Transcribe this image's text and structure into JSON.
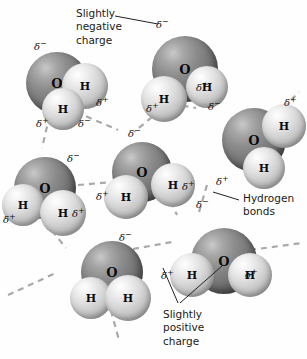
{
  "figure": {
    "background_color": "#fefefe",
    "bond_color": "#a9a9a9",
    "oxygen_color": "#6e6e6e",
    "hydrogen_color": "#d8d8d8",
    "text_color": "#1a1a1a"
  },
  "labels": {
    "negative": "Slightly\nnegative\ncharge",
    "hydrogen_bonds": "Hydrogen\nbonds",
    "positive": "Slightly\npositive\ncharge"
  },
  "atom_symbols": {
    "oxygen": "O",
    "hydrogen": "H"
  },
  "charge_symbols": {
    "negative": "δ",
    "negative_sign": "−",
    "positive": "δ",
    "positive_sign": "+"
  },
  "molecules": [
    {
      "id": "molecule-top-left",
      "atoms": [
        {
          "element": "O",
          "x": 26,
          "y": 52,
          "r": 31
        },
        {
          "element": "H",
          "x": 62,
          "y": 63,
          "r": 23
        },
        {
          "element": "H",
          "x": 42,
          "y": 88,
          "r": 21
        }
      ]
    },
    {
      "id": "molecule-top-right",
      "atoms": [
        {
          "element": "O",
          "x": 152,
          "y": 36,
          "r": 33
        },
        {
          "element": "H",
          "x": 141,
          "y": 76,
          "r": 23
        },
        {
          "element": "H",
          "x": 186,
          "y": 66,
          "r": 21
        }
      ]
    },
    {
      "id": "molecule-right-edge",
      "atoms": [
        {
          "element": "O",
          "x": 222,
          "y": 108,
          "r": 32
        },
        {
          "element": "H",
          "x": 262,
          "y": 104,
          "r": 22
        },
        {
          "element": "H",
          "x": 243,
          "y": 147,
          "r": 21
        }
      ]
    },
    {
      "id": "molecule-left-middle",
      "atoms": [
        {
          "element": "O",
          "x": 14,
          "y": 157,
          "r": 31
        },
        {
          "element": "H",
          "x": 2,
          "y": 184,
          "r": 21
        },
        {
          "element": "H",
          "x": 40,
          "y": 190,
          "r": 23
        }
      ]
    },
    {
      "id": "molecule-center",
      "atoms": [
        {
          "element": "O",
          "x": 112,
          "y": 142,
          "r": 30
        },
        {
          "element": "H",
          "x": 104,
          "y": 175,
          "r": 22
        },
        {
          "element": "H",
          "x": 151,
          "y": 163,
          "r": 22
        }
      ]
    },
    {
      "id": "molecule-bottom-left",
      "atoms": [
        {
          "element": "O",
          "x": 81,
          "y": 241,
          "r": 31
        },
        {
          "element": "H",
          "x": 70,
          "y": 277,
          "r": 21
        },
        {
          "element": "H",
          "x": 105,
          "y": 275,
          "r": 23
        }
      ]
    },
    {
      "id": "molecule-bottom-right",
      "atoms": [
        {
          "element": "O",
          "x": 191,
          "y": 228,
          "r": 33
        },
        {
          "element": "H",
          "x": 170,
          "y": 253,
          "r": 22
        },
        {
          "element": "H",
          "x": 228,
          "y": 253,
          "r": 22
        }
      ]
    }
  ],
  "charge_markers": [
    {
      "id": "charge-1",
      "sign": "negative",
      "x": 34,
      "y": 40
    },
    {
      "id": "charge-2",
      "sign": "negative",
      "x": 156,
      "y": 18
    },
    {
      "id": "charge-3",
      "sign": "positive",
      "x": 96,
      "y": 96
    },
    {
      "id": "charge-4",
      "sign": "positive",
      "x": 36,
      "y": 117
    },
    {
      "id": "charge-5",
      "sign": "positive",
      "x": 146,
      "y": 102
    },
    {
      "id": "charge-6",
      "sign": "positive",
      "x": 196,
      "y": 81
    },
    {
      "id": "charge-7",
      "sign": "negative",
      "x": 208,
      "y": 100
    },
    {
      "id": "charge-8",
      "sign": "positive",
      "x": 284,
      "y": 96
    },
    {
      "id": "charge-9",
      "sign": "negative",
      "x": 128,
      "y": 127
    },
    {
      "id": "charge-10",
      "sign": "negative",
      "x": 67,
      "y": 152
    },
    {
      "id": "charge-11",
      "sign": "positive",
      "x": 3,
      "y": 213
    },
    {
      "id": "charge-12",
      "sign": "positive",
      "x": 96,
      "y": 190
    },
    {
      "id": "charge-13",
      "sign": "positive",
      "x": 182,
      "y": 180
    },
    {
      "id": "charge-14",
      "sign": "positive",
      "x": 72,
      "y": 207
    },
    {
      "id": "charge-15",
      "sign": "positive",
      "x": 216,
      "y": 175
    },
    {
      "id": "charge-16",
      "sign": "negative",
      "x": 196,
      "y": 198
    },
    {
      "id": "charge-17",
      "sign": "negative",
      "x": 119,
      "y": 231
    },
    {
      "id": "charge-18",
      "sign": "positive",
      "x": 161,
      "y": 269
    },
    {
      "id": "charge-19",
      "sign": "positive",
      "x": 245,
      "y": 268
    },
    {
      "id": "charge-20",
      "sign": "negative",
      "x": 78,
      "y": 117
    }
  ],
  "hydrogen_bonds": [
    {
      "id": "bond-1",
      "x1": 76,
      "y1": 112,
      "x2": 118,
      "y2": 130
    },
    {
      "id": "bond-2",
      "x1": 152,
      "y1": 117,
      "x2": 134,
      "y2": 132
    },
    {
      "id": "bond-3",
      "x1": 150,
      "y1": 100,
      "x2": 196,
      "y2": 108
    },
    {
      "id": "bond-4",
      "x1": 207,
      "y1": 94,
      "x2": 224,
      "y2": 104
    },
    {
      "id": "bond-5",
      "x1": 276,
      "y1": 116,
      "x2": 299,
      "y2": 92
    },
    {
      "id": "bond-6",
      "x1": 52,
      "y1": 105,
      "x2": 42,
      "y2": 148
    },
    {
      "id": "bond-7",
      "x1": 78,
      "y1": 185,
      "x2": 112,
      "y2": 182
    },
    {
      "id": "bond-8",
      "x1": 45,
      "y1": 222,
      "x2": 66,
      "y2": 248
    },
    {
      "id": "bond-9",
      "x1": 161,
      "y1": 182,
      "x2": 177,
      "y2": 215
    },
    {
      "id": "bond-10",
      "x1": 207,
      "y1": 185,
      "x2": 199,
      "y2": 212
    },
    {
      "id": "bond-11",
      "x1": 133,
      "y1": 249,
      "x2": 172,
      "y2": 242
    },
    {
      "id": "bond-12",
      "x1": 8,
      "y1": 295,
      "x2": 58,
      "y2": 272
    },
    {
      "id": "bond-13",
      "x1": 108,
      "y1": 300,
      "x2": 119,
      "y2": 340
    },
    {
      "id": "bond-14",
      "x1": 250,
      "y1": 250,
      "x2": 302,
      "y2": 243
    }
  ],
  "leader_lines": [
    {
      "id": "leader-negative",
      "points": "115,16 158,24"
    },
    {
      "id": "leader-hydrogen-bonds",
      "points": "239,200 213,192"
    },
    {
      "id": "leader-positive-left",
      "points": "178,303 163,268"
    },
    {
      "id": "leader-positive-right",
      "points": "180,303 222,266"
    }
  ]
}
